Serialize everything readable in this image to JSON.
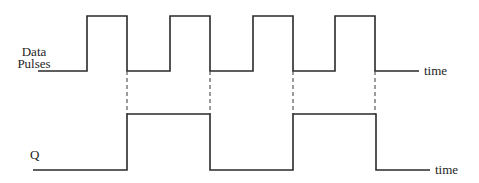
{
  "diagram": {
    "type": "timing-diagram",
    "signals": [
      {
        "name": "data_pulses",
        "label_lines": [
          "Data",
          "Pulses"
        ],
        "axis_label": "time",
        "low_y": 71,
        "high_y": 16,
        "start_x": 38,
        "end_x": 419,
        "pulses": [
          {
            "rise_x": 87,
            "fall_x": 127
          },
          {
            "rise_x": 170,
            "fall_x": 210
          },
          {
            "rise_x": 253,
            "fall_x": 293
          },
          {
            "rise_x": 335,
            "fall_x": 375
          }
        ]
      },
      {
        "name": "q",
        "label": "Q",
        "axis_label": "time",
        "low_y": 170,
        "high_y": 114,
        "start_x": 33,
        "end_x": 430,
        "pulses": [
          {
            "rise_x": 127,
            "fall_x": 210
          },
          {
            "rise_x": 293,
            "fall_x": 376
          }
        ]
      }
    ],
    "guides": [
      {
        "x": 127,
        "from_y": 71,
        "to_y": 114
      },
      {
        "x": 210,
        "from_y": 71,
        "to_y": 114
      },
      {
        "x": 293,
        "from_y": 71,
        "to_y": 114
      },
      {
        "x": 375,
        "from_y": 71,
        "to_y": 114
      }
    ],
    "colors": {
      "line": "#2a2a2a",
      "text": "#1e1e1e",
      "background": "#ffffff"
    }
  },
  "labels": {
    "data_line1": "Data",
    "data_line2": "Pulses",
    "q": "Q",
    "time_top": "time",
    "time_bottom": "time"
  }
}
